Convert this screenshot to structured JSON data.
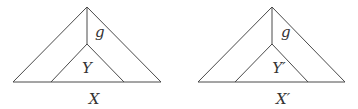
{
  "diagrams": [
    {
      "id": "left",
      "outer_label": "X",
      "inner_label": "Y",
      "edge_label": "g",
      "outer": {
        "apex": [
          87,
          7
        ],
        "base_left": [
          13,
          82
        ],
        "base_right": [
          161,
          82
        ]
      },
      "inner": {
        "apex": [
          87,
          44
        ],
        "base_left": [
          51,
          82
        ],
        "base_right": [
          124,
          82
        ]
      },
      "label_pos": {
        "edge": [
          95,
          37
        ],
        "inner": [
          87,
          73
        ],
        "outer": [
          94,
          104
        ]
      }
    },
    {
      "id": "right",
      "outer_label": "X′",
      "inner_label": "Y′",
      "edge_label": "g",
      "outer": {
        "apex": [
          272,
          7
        ],
        "base_left": [
          198,
          82
        ],
        "base_right": [
          345,
          82
        ]
      },
      "inner": {
        "apex": [
          272,
          44
        ],
        "base_left": [
          235,
          82
        ],
        "base_right": [
          308,
          82
        ]
      },
      "label_pos": {
        "edge": [
          281,
          37
        ],
        "inner": [
          279,
          73
        ],
        "outer": [
          283,
          104
        ]
      }
    }
  ],
  "colors": {
    "line": "#4a4a4a",
    "text": "#333333",
    "background": "#ffffff"
  }
}
